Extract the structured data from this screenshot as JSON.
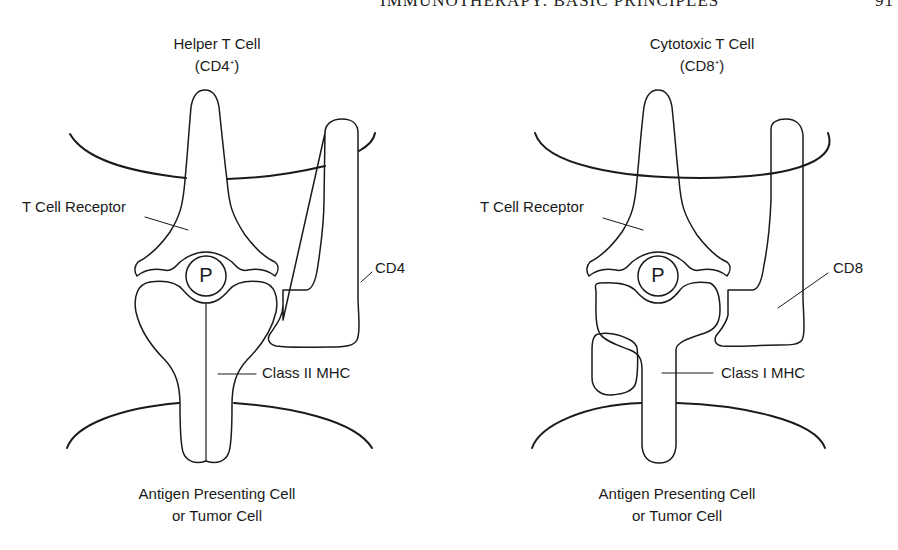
{
  "running_head": {
    "text": "IMMUNOTHERAPY: BASIC PRINCIPLES",
    "page_number": "91"
  },
  "panels": [
    {
      "id": "helper",
      "title": "Helper T Cell",
      "subtitle_base": "(CD4",
      "subtitle_sup": "+",
      "subtitle_end": ")",
      "labels": {
        "receptor": "T Cell Receptor",
        "coreceptor": "CD4",
        "mhc": "Class II MHC",
        "peptide": "P"
      },
      "bottom_line1": "Antigen Presenting Cell",
      "bottom_line2": "or Tumor Cell"
    },
    {
      "id": "cytotoxic",
      "title": "Cytotoxic T Cell",
      "subtitle_base": "(CD8",
      "subtitle_sup": "+",
      "subtitle_end": ")",
      "labels": {
        "receptor": "T Cell Receptor",
        "coreceptor": "CD8",
        "mhc": "Class I MHC",
        "peptide": "P"
      },
      "bottom_line1": "Antigen Presenting Cell",
      "bottom_line2": "or Tumor Cell"
    }
  ],
  "colors": {
    "line": "#1a1a1a",
    "background": "#ffffff"
  }
}
